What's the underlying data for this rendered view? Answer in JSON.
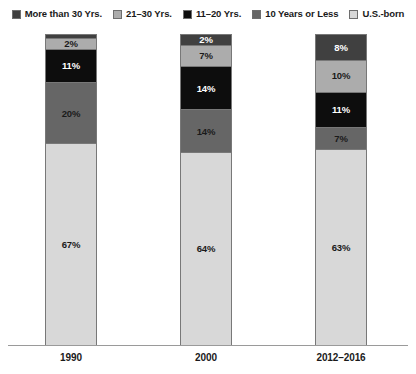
{
  "legend": {
    "position": "top",
    "items": [
      {
        "label": "More than 30 Yrs.",
        "color": "#404040"
      },
      {
        "label": "21–30 Yrs.",
        "color": "#ACACAC"
      },
      {
        "label": "11–20 Yrs.",
        "color": "#0D0D0D"
      },
      {
        "label": "10 Years or Less",
        "color": "#666666"
      },
      {
        "label": "U.S.-born",
        "color": "#D8D8D8"
      }
    ]
  },
  "axis": {
    "categories": [
      "1990",
      "2000",
      "2012–2016"
    ]
  },
  "bars": {
    "b1990": {
      "category": "1990",
      "segments": [
        {
          "series": "More than 30 Yrs.",
          "value": 1,
          "label": ""
        },
        {
          "series": "21–30 Yrs.",
          "value": 2,
          "label": "2%"
        },
        {
          "series": "11–20 Yrs.",
          "value": 11,
          "label": "11%"
        },
        {
          "series": "10 Years or Less",
          "value": 20,
          "label": "20%"
        },
        {
          "series": "U.S.-born",
          "value": 67,
          "label": "67%"
        }
      ]
    },
    "b2000": {
      "category": "2000",
      "segments": [
        {
          "series": "More than 30 Yrs.",
          "value": 2,
          "label": "2%"
        },
        {
          "series": "21–30 Yrs.",
          "value": 7,
          "label": "7%"
        },
        {
          "series": "11–20 Yrs.",
          "value": 14,
          "label": "14%"
        },
        {
          "series": "10 Years or Less",
          "value": 14,
          "label": "14%"
        },
        {
          "series": "U.S.-born",
          "value": 64,
          "label": "64%"
        }
      ]
    },
    "b2012": {
      "category": "2012–2016",
      "segments": [
        {
          "series": "More than 30 Yrs.",
          "value": 8,
          "label": "8%"
        },
        {
          "series": "21–30 Yrs.",
          "value": 10,
          "label": "10%"
        },
        {
          "series": "11–20 Yrs.",
          "value": 11,
          "label": "11%"
        },
        {
          "series": "10 Years or Less",
          "value": 7,
          "label": "7%"
        },
        {
          "series": "U.S.-born",
          "value": 63,
          "label": "63%"
        }
      ]
    }
  },
  "chart_data": {
    "type": "bar",
    "subtype": "stacked-100-percent",
    "title": "",
    "subtitle": "",
    "xlabel": "",
    "ylabel": "",
    "ylim": [
      0,
      100
    ],
    "grid": false,
    "legend_position": "top",
    "categories": [
      "1990",
      "2000",
      "2012–2016"
    ],
    "series": [
      {
        "name": "More than 30 Yrs.",
        "color": "#404040",
        "values": [
          1,
          2,
          8
        ],
        "labels": [
          "",
          "2%",
          "8%"
        ]
      },
      {
        "name": "21–30 Yrs.",
        "color": "#ACACAC",
        "values": [
          2,
          7,
          10
        ],
        "labels": [
          "2%",
          "7%",
          "10%"
        ]
      },
      {
        "name": "11–20 Yrs.",
        "color": "#0D0D0D",
        "values": [
          11,
          14,
          11
        ],
        "labels": [
          "11%",
          "14%",
          "11%"
        ]
      },
      {
        "name": "10 Years or Less",
        "color": "#666666",
        "values": [
          20,
          14,
          7
        ],
        "labels": [
          "20%",
          "14%",
          "7%"
        ]
      },
      {
        "name": "U.S.-born",
        "color": "#D8D8D8",
        "values": [
          67,
          64,
          63
        ],
        "labels": [
          "67%",
          "64%",
          "63%"
        ]
      }
    ],
    "stack_order_top_to_bottom": [
      "More than 30 Yrs.",
      "21–30 Yrs.",
      "11–20 Yrs.",
      "10 Years or Less",
      "U.S.-born"
    ]
  }
}
